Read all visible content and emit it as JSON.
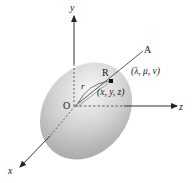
{
  "diagram": {
    "type": "3d-coordinate-ellipsoid",
    "axes": {
      "x": {
        "label": "x"
      },
      "y": {
        "label": "y"
      },
      "z": {
        "label": "z"
      }
    },
    "origin": {
      "label": "O"
    },
    "direction_point": {
      "label": "A",
      "coords_label": "(λ, μ, ν)"
    },
    "surface_point": {
      "label": "R",
      "coords_label": "(x, y, z)"
    },
    "radius": {
      "label": "r"
    },
    "colors": {
      "ellipsoid_light": "#f2f2f2",
      "ellipsoid_dark": "#a8a8a8",
      "axis": "#333333",
      "text": "#222222"
    }
  }
}
